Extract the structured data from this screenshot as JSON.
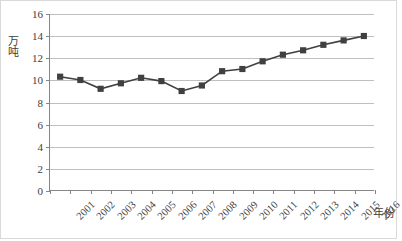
{
  "chart_data": {
    "type": "line",
    "title": "",
    "subtitle": "",
    "xlabel": "年份",
    "ylabel": "万吨",
    "categories": [
      "2001",
      "2002",
      "2003",
      "2004",
      "2005",
      "2006",
      "2007",
      "2008",
      "2009",
      "2010",
      "2011",
      "2012",
      "2013",
      "2014",
      "2015",
      "2016"
    ],
    "values": [
      10.3,
      10.0,
      9.2,
      9.7,
      10.2,
      9.9,
      9.0,
      9.5,
      10.8,
      11.0,
      11.7,
      12.3,
      12.7,
      13.2,
      13.6,
      14.0
    ],
    "series": [
      {
        "name": "",
        "values": [
          10.3,
          10.0,
          9.2,
          9.7,
          10.2,
          9.9,
          9.0,
          9.5,
          10.8,
          11.0,
          11.7,
          12.3,
          12.7,
          13.2,
          13.6,
          14.0
        ]
      }
    ],
    "ylim": [
      0,
      16
    ],
    "y_ticks": [
      0,
      2,
      4,
      6,
      8,
      10,
      12,
      14,
      16
    ],
    "y_tick_labels": [
      "0",
      "2",
      "4",
      "6",
      "8",
      "10",
      "12",
      "14",
      "16"
    ],
    "grid": true,
    "grid_axis": "y",
    "legend": false,
    "legend_position": "none",
    "marker": "square",
    "colors": {
      "line": "#404040",
      "marker": "#404040",
      "grid": "#bfbfbf",
      "axis": "#868686",
      "text": "#404040",
      "background": "#ffffff",
      "border": "#d9d9d9"
    }
  }
}
